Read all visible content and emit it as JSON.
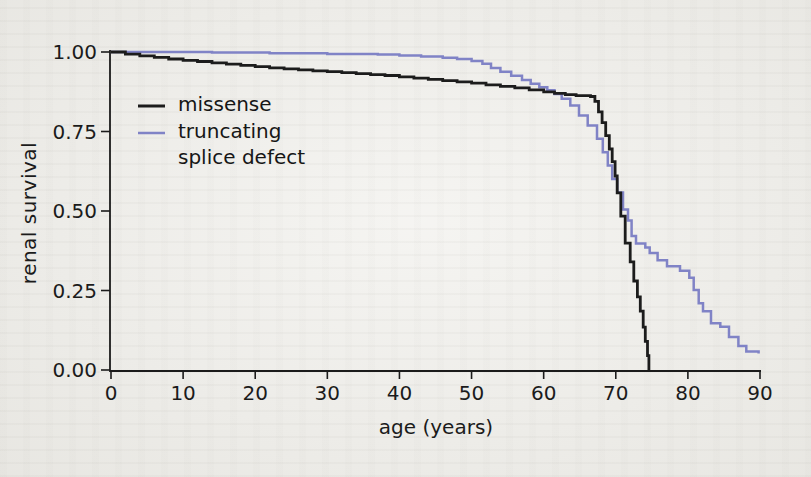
{
  "figure": {
    "paper_color": "#f1f0ec",
    "axis_color": "#1b1b1b"
  },
  "chart_data": {
    "type": "line",
    "subtype": "kaplan-meier-step-curve",
    "title": "",
    "xlabel": "age (years)",
    "ylabel": "renal survival",
    "xlim": [
      0,
      90
    ],
    "ylim": [
      0.0,
      1.0
    ],
    "x_ticks": [
      0,
      10,
      20,
      30,
      40,
      50,
      60,
      70,
      80,
      90
    ],
    "y_ticks": [
      {
        "value": 1.0,
        "label": "1.00"
      },
      {
        "value": 0.75,
        "label": "0.75"
      },
      {
        "value": 0.5,
        "label": "0.50"
      },
      {
        "value": 0.25,
        "label": "0.25"
      },
      {
        "value": 0.0,
        "label": "0.00"
      }
    ],
    "grid": false,
    "legend_position": "upper-left-inside",
    "legend": {
      "items": [
        {
          "swatch_color": "#1c1c1c",
          "lines": [
            "missense"
          ]
        },
        {
          "swatch_color": "#8083c6",
          "lines": [
            "truncating",
            "splice defect"
          ]
        }
      ]
    },
    "series": [
      {
        "name": "missense",
        "color": "#1c1c1c",
        "stroke_width": 2.8,
        "points": [
          [
            0,
            1.0
          ],
          [
            2,
            0.993
          ],
          [
            4,
            0.988
          ],
          [
            6,
            0.983
          ],
          [
            8,
            0.978
          ],
          [
            10,
            0.974
          ],
          [
            12,
            0.97
          ],
          [
            14,
            0.966
          ],
          [
            16,
            0.962
          ],
          [
            18,
            0.958
          ],
          [
            20,
            0.954
          ],
          [
            22,
            0.95
          ],
          [
            24,
            0.947
          ],
          [
            26,
            0.944
          ],
          [
            28,
            0.941
          ],
          [
            30,
            0.938
          ],
          [
            32,
            0.935
          ],
          [
            34,
            0.932
          ],
          [
            36,
            0.929
          ],
          [
            38,
            0.926
          ],
          [
            40,
            0.922
          ],
          [
            42,
            0.918
          ],
          [
            44,
            0.914
          ],
          [
            46,
            0.91
          ],
          [
            48,
            0.906
          ],
          [
            50,
            0.902
          ],
          [
            52,
            0.897
          ],
          [
            54,
            0.892
          ],
          [
            56,
            0.887
          ],
          [
            58,
            0.881
          ],
          [
            60,
            0.875
          ],
          [
            61.5,
            0.87
          ],
          [
            63,
            0.866
          ],
          [
            64.5,
            0.863
          ],
          [
            66.5,
            0.86
          ],
          [
            67.1,
            0.845
          ],
          [
            67.6,
            0.812
          ],
          [
            68.1,
            0.778
          ],
          [
            68.6,
            0.737
          ],
          [
            69.1,
            0.695
          ],
          [
            69.5,
            0.655
          ],
          [
            69.9,
            0.61
          ],
          [
            70.2,
            0.557
          ],
          [
            70.7,
            0.484
          ],
          [
            71.3,
            0.399
          ],
          [
            72.0,
            0.34
          ],
          [
            72.5,
            0.28
          ],
          [
            73.0,
            0.23
          ],
          [
            73.4,
            0.185
          ],
          [
            73.8,
            0.135
          ],
          [
            74.1,
            0.09
          ],
          [
            74.4,
            0.045
          ],
          [
            74.6,
            0.0
          ]
        ]
      },
      {
        "name": "truncating splice defect",
        "color": "#8083c6",
        "stroke_width": 2.5,
        "points": [
          [
            0,
            1.0
          ],
          [
            14,
            0.998
          ],
          [
            22,
            0.996
          ],
          [
            30,
            0.994
          ],
          [
            37,
            0.992
          ],
          [
            40,
            0.989
          ],
          [
            43,
            0.986
          ],
          [
            46,
            0.982
          ],
          [
            48,
            0.978
          ],
          [
            50,
            0.972
          ],
          [
            51.5,
            0.963
          ],
          [
            52.7,
            0.95
          ],
          [
            54,
            0.938
          ],
          [
            55.5,
            0.925
          ],
          [
            57,
            0.912
          ],
          [
            58.2,
            0.9
          ],
          [
            59.4,
            0.889
          ],
          [
            60.5,
            0.88
          ],
          [
            61.5,
            0.868
          ],
          [
            62.5,
            0.853
          ],
          [
            63.7,
            0.832
          ],
          [
            64.9,
            0.8
          ],
          [
            66.1,
            0.769
          ],
          [
            67.4,
            0.727
          ],
          [
            68.2,
            0.685
          ],
          [
            68.9,
            0.643
          ],
          [
            69.5,
            0.601
          ],
          [
            70.2,
            0.558
          ],
          [
            71.0,
            0.505
          ],
          [
            71.7,
            0.47
          ],
          [
            72.2,
            0.421
          ],
          [
            72.8,
            0.398
          ],
          [
            74.1,
            0.385
          ],
          [
            74.7,
            0.368
          ],
          [
            75.8,
            0.345
          ],
          [
            77.1,
            0.326
          ],
          [
            78.9,
            0.312
          ],
          [
            80.2,
            0.29
          ],
          [
            80.8,
            0.252
          ],
          [
            81.5,
            0.21
          ],
          [
            82.1,
            0.185
          ],
          [
            83.2,
            0.147
          ],
          [
            84.5,
            0.136
          ],
          [
            85.7,
            0.104
          ],
          [
            87.0,
            0.075
          ],
          [
            88.1,
            0.058
          ],
          [
            89.8,
            0.052
          ]
        ]
      }
    ],
    "plot_geometry": {
      "x_px_at_0": 111,
      "x_px_at_90": 760,
      "y_px_at_1": 52,
      "y_px_at_0": 370
    }
  }
}
